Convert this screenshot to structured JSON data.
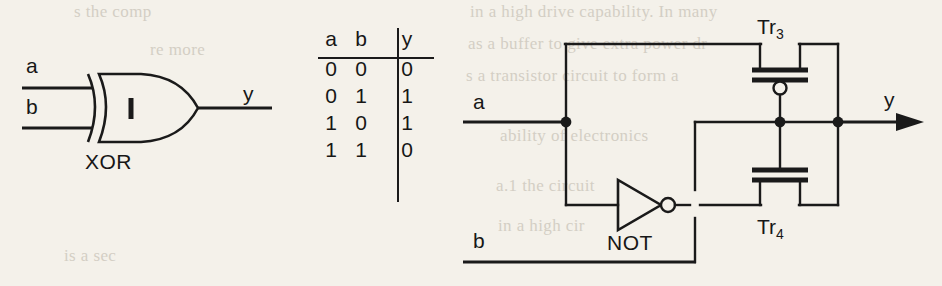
{
  "figure": {
    "kind": "logic-diagram",
    "background_color": "#f4f1ea",
    "ink_color": "#1a1a1a"
  },
  "xor_symbol": {
    "gate_label": "XOR",
    "inner_marker": "1",
    "inputs": [
      {
        "name": "a",
        "label": "a"
      },
      {
        "name": "b",
        "label": "b"
      }
    ],
    "output": {
      "name": "y",
      "label": "y"
    }
  },
  "truth_table": {
    "headers": [
      "a",
      "b",
      "y"
    ],
    "rows": [
      [
        "0",
        "0",
        "0"
      ],
      [
        "0",
        "1",
        "1"
      ],
      [
        "1",
        "0",
        "1"
      ],
      [
        "1",
        "1",
        "0"
      ]
    ]
  },
  "transistor_circuit": {
    "inputs": [
      {
        "name": "a",
        "label": "a"
      },
      {
        "name": "b",
        "label": "b"
      }
    ],
    "output": {
      "name": "y",
      "label": "y"
    },
    "inverter": {
      "label": "NOT",
      "type": "inverting-buffer"
    },
    "transistors": [
      {
        "name": "Tr3",
        "label": "Tr",
        "subscript": "3",
        "type": "pmos",
        "has_gate_bubble": true
      },
      {
        "name": "Tr4",
        "label": "Tr",
        "subscript": "4",
        "type": "nmos",
        "has_gate_bubble": false
      }
    ]
  },
  "bleed_through_text": {
    "lines": [
      {
        "text": "in a high drive capability. In many",
        "x": 470,
        "y": 2
      },
      {
        "text": "as a buffer to give extra power dr",
        "x": 468,
        "y": 34
      },
      {
        "text": "s a transistor circuit to form a",
        "x": 466,
        "y": 66
      },
      {
        "text": "ability of electronics",
        "x": 500,
        "y": 126
      },
      {
        "text": "a.1 the circuit",
        "x": 496,
        "y": 176
      },
      {
        "text": "in a high cir",
        "x": 498,
        "y": 216
      },
      {
        "text": "s the comp",
        "x": 74,
        "y": 2
      },
      {
        "text": "re more",
        "x": 150,
        "y": 40
      },
      {
        "text": "is a sec",
        "x": 64,
        "y": 246
      }
    ]
  }
}
